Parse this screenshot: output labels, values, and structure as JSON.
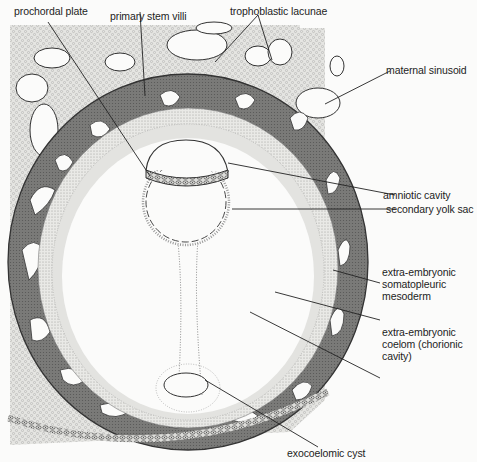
{
  "figure": {
    "type": "anatomical cross-section",
    "colors": {
      "background": "#fbfbfa",
      "endometrium_stipple": "#c9c9c7",
      "trophoblast_dark": "#6f6f6f",
      "mesoderm_light": "#d6d6d3",
      "outline": "#2a2a2a",
      "leader_line": "#222222"
    }
  },
  "labels": {
    "prochordal_plate": "prochordal plate",
    "primary_stem_villi": "primary stem villi",
    "trophoblastic_lacunae": "trophoblastic lacunae",
    "maternal_sinusoid": "maternal sinusoid",
    "amniotic_cavity": "amniotic cavity",
    "secondary_yolk_sac": "secondary yolk sac",
    "somatopleuric_mesoderm": {
      "line1": "extra-embryonic",
      "line2": "somatopleuric",
      "line3": "mesoderm"
    },
    "chorionic_cavity": {
      "line1": "extra-embryonic",
      "line2": "coelom (chorionic",
      "line3": "cavity)"
    },
    "exocoelomic_cyst": "exocoelomic cyst"
  }
}
